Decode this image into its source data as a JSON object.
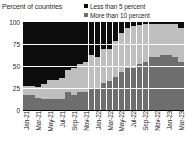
{
  "chart_data": {
    "type": "bar",
    "subtype": "stacked-100-percent",
    "title": "Percent of countries",
    "xlabel": "",
    "ylabel": "",
    "ylim": [
      0,
      100
    ],
    "yticks": [
      0,
      25,
      50,
      75,
      100
    ],
    "grid": true,
    "legend_position": "top-right",
    "categories": [
      "Jan-21",
      "Feb-21",
      "Mar-21",
      "Apr-21",
      "May-21",
      "Jun-21",
      "Jul-21",
      "Aug-21",
      "Sep-21",
      "Oct-21",
      "Nov-21",
      "Dec-21",
      "Jan-22",
      "Feb-22",
      "Mar-22",
      "Apr-22",
      "May-22",
      "Jun-22",
      "Jul-22",
      "Aug-22",
      "Sep-22",
      "Oct-22",
      "Nov-22",
      "Dec-22",
      "Jan-23",
      "Feb-23",
      "Mar-23"
    ],
    "tick_labels": [
      "Jan-21",
      "Mar-21",
      "May-21",
      "Jul-21",
      "Sep-21",
      "Nov-21",
      "Jan-22",
      "Mar-22",
      "May-22",
      "Jul-22",
      "Sep-22",
      "Nov-22",
      "Jan-23",
      "Mar-23"
    ],
    "series": [
      {
        "name": "More than 10 percent",
        "color": "#6e6e6e",
        "stack_position": "bottom",
        "values": [
          17,
          17,
          14,
          12,
          12,
          12,
          12,
          20,
          17,
          21,
          21,
          24,
          24,
          31,
          33,
          38,
          43,
          48,
          48,
          52,
          55,
          60,
          60,
          62,
          62,
          60,
          55
        ]
      },
      {
        "name": "Between 5 and 10 percent",
        "color": "#bfbfbf",
        "stack_position": "middle",
        "values": [
          10,
          10,
          12,
          17,
          22,
          22,
          24,
          26,
          31,
          31,
          33,
          38,
          36,
          38,
          36,
          40,
          45,
          45,
          48,
          45,
          43,
          38,
          38,
          36,
          36,
          38,
          38
        ]
      },
      {
        "name": "Less than 5 percent",
        "color": "#0d0d0d",
        "stack_position": "top",
        "values": [
          73,
          73,
          74,
          71,
          66,
          66,
          64,
          54,
          52,
          48,
          46,
          38,
          40,
          31,
          31,
          22,
          12,
          7,
          4,
          3,
          2,
          2,
          2,
          2,
          2,
          2,
          7
        ]
      }
    ]
  },
  "legend": {
    "items": [
      {
        "label": "Less than 5 percent",
        "color": "#0d0d0d"
      },
      {
        "label": "More than 10 percent",
        "color": "#6e6e6e"
      }
    ]
  },
  "axes": {
    "y_ticks": [
      "100",
      "75",
      "50",
      "25",
      "0"
    ]
  }
}
